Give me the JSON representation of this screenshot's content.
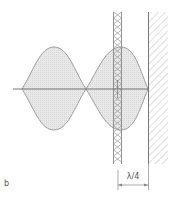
{
  "figure": {
    "panel_label": "b",
    "dimension_label": "λ/4",
    "colors": {
      "line": "#777777",
      "fill": "#e4e4e4",
      "hatch": "#aaaaaa",
      "absorber": "#888888",
      "text": "#555555"
    },
    "elements": {
      "axis": "horizontal propagation axis",
      "envelope_lobes": 2,
      "absorber": "cross-hatched porous layer",
      "wall": "diagonally hatched rigid wall"
    }
  }
}
